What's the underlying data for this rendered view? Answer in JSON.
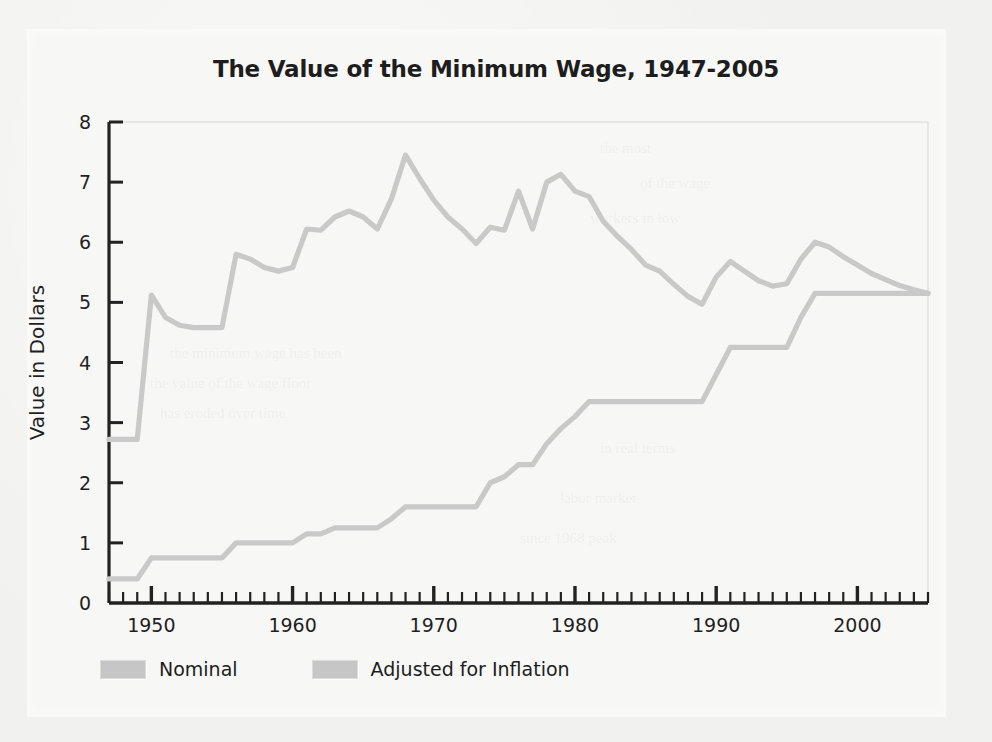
{
  "chart_data": {
    "type": "line",
    "title": "The Value of the Minimum Wage, 1947-2005",
    "xlabel": "",
    "ylabel": "Value in Dollars",
    "xlim": [
      1947,
      2005
    ],
    "ylim": [
      0,
      8
    ],
    "yticks": [
      0,
      1,
      2,
      3,
      4,
      5,
      6,
      7,
      8
    ],
    "ytick_labels": [
      "0",
      "1",
      "2",
      "3",
      "4",
      "5",
      "6",
      "7",
      "8"
    ],
    "xticks_major": [
      1950,
      1960,
      1970,
      1980,
      1990,
      2000
    ],
    "xtick_labels": [
      "1950",
      "1960",
      "1970",
      "1980",
      "1990",
      "2000"
    ],
    "xtick_minor_step": 1,
    "grid": false,
    "legend_position": "below-left",
    "x": [
      1947,
      1948,
      1949,
      1950,
      1951,
      1952,
      1953,
      1954,
      1955,
      1956,
      1957,
      1958,
      1959,
      1960,
      1961,
      1962,
      1963,
      1964,
      1965,
      1966,
      1967,
      1968,
      1969,
      1970,
      1971,
      1972,
      1973,
      1974,
      1975,
      1976,
      1977,
      1978,
      1979,
      1980,
      1981,
      1982,
      1983,
      1984,
      1985,
      1986,
      1987,
      1988,
      1989,
      1990,
      1991,
      1992,
      1993,
      1994,
      1995,
      1996,
      1997,
      1998,
      1999,
      2000,
      2001,
      2002,
      2003,
      2004,
      2005
    ],
    "series": [
      {
        "name": "Nominal",
        "color": "#c9c9c9",
        "values": [
          0.4,
          0.4,
          0.4,
          0.75,
          0.75,
          0.75,
          0.75,
          0.75,
          0.75,
          1.0,
          1.0,
          1.0,
          1.0,
          1.0,
          1.15,
          1.15,
          1.25,
          1.25,
          1.25,
          1.25,
          1.4,
          1.6,
          1.6,
          1.6,
          1.6,
          1.6,
          1.6,
          2.0,
          2.1,
          2.3,
          2.3,
          2.65,
          2.9,
          3.1,
          3.35,
          3.35,
          3.35,
          3.35,
          3.35,
          3.35,
          3.35,
          3.35,
          3.35,
          3.8,
          4.25,
          4.25,
          4.25,
          4.25,
          4.25,
          4.75,
          5.15,
          5.15,
          5.15,
          5.15,
          5.15,
          5.15,
          5.15,
          5.15,
          5.15
        ]
      },
      {
        "name": "Adjusted for Inflation",
        "color": "#c9c9c9",
        "values": [
          2.72,
          2.72,
          2.72,
          5.12,
          4.75,
          4.62,
          4.58,
          4.58,
          4.58,
          5.8,
          5.72,
          5.58,
          5.52,
          5.58,
          6.22,
          6.2,
          6.42,
          6.52,
          6.42,
          6.22,
          6.72,
          7.45,
          7.06,
          6.7,
          6.42,
          6.22,
          5.98,
          6.25,
          6.2,
          6.85,
          6.22,
          7.0,
          7.13,
          6.85,
          6.76,
          6.35,
          6.1,
          5.88,
          5.62,
          5.52,
          5.3,
          5.1,
          4.97,
          5.42,
          5.68,
          5.52,
          5.36,
          5.27,
          5.31,
          5.72,
          6.0,
          5.92,
          5.76,
          5.62,
          5.48,
          5.38,
          5.28,
          5.21,
          5.15
        ]
      }
    ]
  },
  "legend": {
    "entries": [
      {
        "label": "Nominal",
        "color": "#c6c6c6"
      },
      {
        "label": "Adjusted for Inflation",
        "color": "#c6c6c6"
      }
    ]
  },
  "axes": {
    "y_title": "Value in Dollars",
    "axis_color": "#222222"
  }
}
